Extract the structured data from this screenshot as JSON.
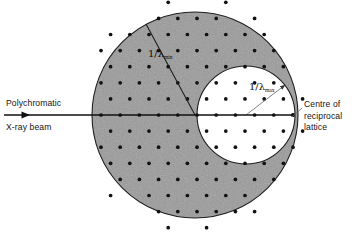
{
  "figure": {
    "type": "reciprocal-lattice-ewald-construction",
    "canvas": {
      "width": 361,
      "height": 233,
      "background": "#ffffff"
    },
    "colors": {
      "shaded_annulus_fill": "#9a9a9a",
      "inner_circle_fill": "#ffffff",
      "stroke": "#1a1a1a",
      "lattice_point": "#111111",
      "leader_line": "#555555",
      "text": "#141414"
    },
    "outer_circle": {
      "name": "sphere-min-wavelength",
      "cx": 195,
      "cy": 115,
      "r": 103,
      "label": "1/λmin",
      "fill": "#9a9a9a"
    },
    "inner_circle": {
      "name": "sphere-max-wavelength",
      "cx": 246,
      "cy": 115,
      "r": 49,
      "label": "1/λmax",
      "fill": "#ffffff"
    },
    "beam": {
      "name": "polychromatic-x-ray-beam",
      "x_start": 4,
      "x_end": 293,
      "y": 115,
      "arrow_at": 25,
      "terminates_at": "centre-of-reciprocal-lattice"
    },
    "origin_point": {
      "cx": 293,
      "cy": 115,
      "r": 2.0
    },
    "lattice": {
      "name": "reciprocal-lattice-points",
      "pitch_x": 19.2,
      "pitch_y": 16.1,
      "row_offset_x": 9.6,
      "dot_radius": 1.85,
      "origin_x": 293,
      "origin_y": 115
    }
  },
  "labels": {
    "beam_line1": "Polychromatic",
    "beam_line2": "X-ray beam",
    "centre_line1": "Centre of",
    "centre_line2": "reciprocal",
    "centre_line3": "lattice",
    "lambda_min_prefix": "1/λ",
    "lambda_min_sub": "min",
    "lambda_max_prefix": "1/λ",
    "lambda_max_sub": "max"
  },
  "radius_lines": {
    "min_radius_line": {
      "x1": 195,
      "y1": 115,
      "x2": 146,
      "y2": 24,
      "name": "radius-1-over-lambda-min"
    },
    "max_radius_line": {
      "x1": 246,
      "y1": 115,
      "x2": 285,
      "y2": 85,
      "name": "radius-1-over-lambda-max"
    }
  },
  "leader_lines": {
    "centre_leader": {
      "x1": 302,
      "y1": 108,
      "x2": 292,
      "y2": 117,
      "name": "leader-to-centre-of-reciprocal-lattice"
    }
  }
}
